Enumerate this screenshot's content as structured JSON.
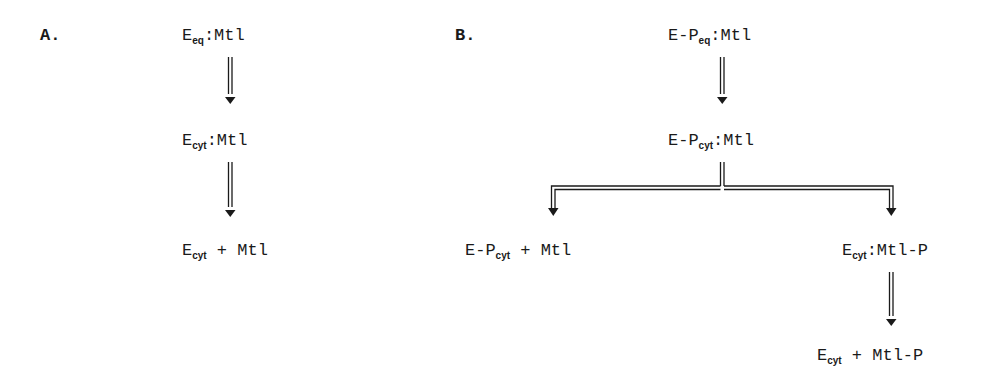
{
  "panels": {
    "a": {
      "label": "A.",
      "species": [
        {
          "main": "E",
          "sub": "eq",
          "rest": ":Mtl"
        },
        {
          "main": "E",
          "sub": "cyt",
          "rest": ":Mtl"
        },
        {
          "main": "E",
          "sub": "cyt",
          "rest": " + Mtl"
        }
      ],
      "arrows": [
        {
          "from": 0,
          "to": 1,
          "style": "double-line"
        },
        {
          "from": 1,
          "to": 2,
          "style": "double-line"
        }
      ]
    },
    "b": {
      "label": "B.",
      "species": [
        {
          "main": "E-P",
          "sub": "eq",
          "rest": ":Mtl"
        },
        {
          "main": "E-P",
          "sub": "cyt",
          "rest": ":Mtl"
        },
        {
          "main": "E-P",
          "sub": "cyt",
          "rest": " + Mtl"
        },
        {
          "main": "E",
          "sub": "cyt",
          "rest": ":Mtl-P"
        },
        {
          "main": "E",
          "sub": "cyt",
          "rest": " + Mtl-P"
        }
      ],
      "arrows": [
        {
          "from": 0,
          "to": 1,
          "style": "double-line"
        },
        {
          "from": 1,
          "to": 2,
          "style": "double-line-branch-left"
        },
        {
          "from": 1,
          "to": 3,
          "style": "double-line-branch-right"
        },
        {
          "from": 3,
          "to": 4,
          "style": "double-line"
        }
      ]
    }
  },
  "colors": {
    "ink": "#1a1a1a",
    "background": "#ffffff"
  }
}
